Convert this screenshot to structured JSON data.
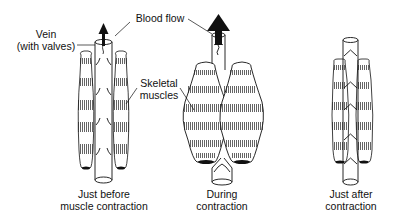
{
  "diagram": {
    "labels": {
      "vein_line1": "Vein",
      "vein_line2": "(with valves)",
      "blood_flow": "Blood flow",
      "skeletal_line1": "Skeletal",
      "skeletal_line2": "muscles"
    },
    "panels": [
      {
        "id": "before",
        "caption_line1": "Just before",
        "caption_line2": "muscle contraction"
      },
      {
        "id": "during",
        "caption_line1": "During",
        "caption_line2": "contraction"
      },
      {
        "id": "after",
        "caption_line1": "Just after",
        "caption_line2": "contraction"
      }
    ],
    "colors": {
      "ink": "#111111",
      "background": "#ffffff"
    }
  }
}
